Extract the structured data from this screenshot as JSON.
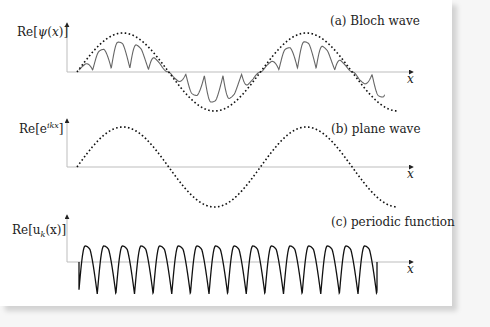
{
  "figure": {
    "panels": [
      {
        "id": "a",
        "y_label": "Re[ψ(x)]",
        "x_label": "x",
        "caption": "(a) Bloch wave",
        "curves": [
          "Bloch wave (solid, grey): plane wave modulated by periodic function",
          "envelope (dotted): plane wave"
        ]
      },
      {
        "id": "b",
        "y_label": "Re[e^{ikx}]",
        "y_label_base": "Re[e",
        "y_label_sup": "ikx",
        "y_label_end": "]",
        "x_label": "x",
        "caption": "(b) plane wave",
        "curves": [
          "plane wave (dotted)"
        ]
      },
      {
        "id": "c",
        "y_label": "Re[u_k(x)]",
        "y_label_base": "Re[u",
        "y_label_sub": "k",
        "y_label_end": "(x)]",
        "x_label": "x",
        "caption": "(c) periodic function",
        "curves": [
          "periodic function u_k(x) (solid, black)"
        ]
      }
    ],
    "colors": {
      "background": "#ffffff",
      "axis": "#bdbdbd",
      "dotted_curve": "#111111",
      "bloch_curve": "#666666",
      "periodic_curve": "#111111"
    }
  },
  "chart_data": [
    {
      "type": "line",
      "title": "(a) Bloch wave",
      "xlabel": "x",
      "ylabel": "Re[ψ(x)]",
      "series": [
        {
          "name": "Re[ψ(x)]",
          "style": "solid grey",
          "description": "product of plane wave (≈1.75 periods) and periodic function (≈16 periods)"
        },
        {
          "name": "envelope e^{ikx}",
          "style": "dotted",
          "periods": 1.75
        }
      ],
      "grid": false
    },
    {
      "type": "line",
      "title": "(b) plane wave",
      "xlabel": "x",
      "ylabel": "Re[e^{ikx}]",
      "series": [
        {
          "name": "Re[e^{ikx}]",
          "style": "dotted",
          "periods": 1.75
        }
      ],
      "grid": false
    },
    {
      "type": "line",
      "title": "(c) periodic function",
      "xlabel": "x",
      "ylabel": "Re[u_k(x)]",
      "series": [
        {
          "name": "Re[u_k(x)]",
          "style": "solid black",
          "periods": 16
        }
      ],
      "grid": false
    }
  ]
}
